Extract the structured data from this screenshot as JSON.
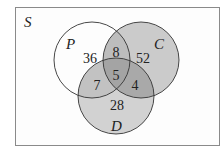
{
  "universe_label": "S",
  "sets": {
    "P": {
      "label": "P"
    },
    "C": {
      "label": "C"
    },
    "D": {
      "label": "D"
    }
  },
  "regions": {
    "P_only": "36",
    "C_only": "52",
    "D_only": "28",
    "P_and_C_only": "8",
    "P_and_D_only": "7",
    "C_and_D_only": "4",
    "P_and_C_and_D": "5"
  },
  "colors": {
    "frame": "#7a7a7a",
    "outline": "#333333",
    "C_fill": "#c8c8c8",
    "D_fill": "#cfcfcf",
    "background": "#ffffff"
  }
}
